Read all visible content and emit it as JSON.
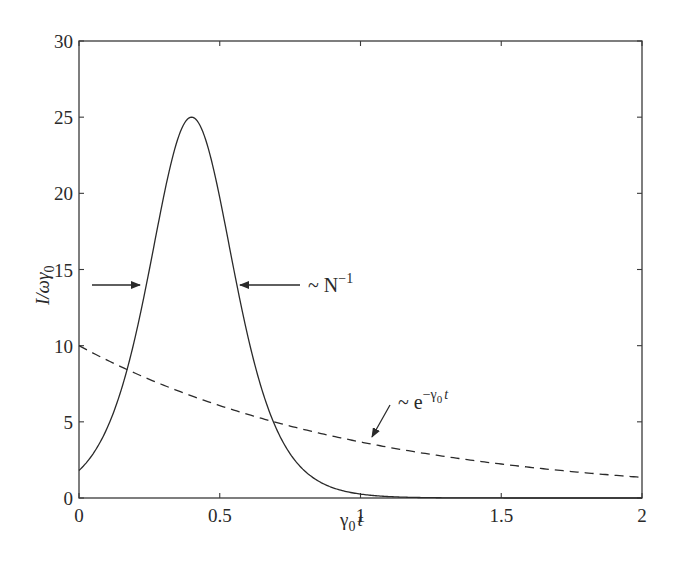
{
  "chart_data": {
    "type": "line",
    "title": "",
    "xlabel": "γ0 t",
    "ylabel": "I/ωγ0",
    "xlim": [
      0,
      2
    ],
    "ylim": [
      0,
      30
    ],
    "xticks": [
      0,
      0.5,
      1,
      1.5,
      2
    ],
    "xtick_labels": [
      "0",
      "0.5",
      "1",
      "1.5",
      "2"
    ],
    "yticks": [
      0,
      5,
      10,
      15,
      20,
      25,
      30
    ],
    "ytick_labels": [
      "0",
      "5",
      "10",
      "15",
      "20",
      "25",
      "30"
    ],
    "grid": false,
    "legend": null,
    "series": [
      {
        "name": "superradiant pulse",
        "style": "solid",
        "x": [
          0,
          0.05,
          0.1,
          0.15,
          0.2,
          0.25,
          0.3,
          0.35,
          0.4,
          0.45,
          0.5,
          0.55,
          0.6,
          0.65,
          0.7,
          0.75,
          0.8,
          0.85,
          0.9,
          0.95,
          1.0,
          1.1,
          1.2,
          1.3,
          1.5,
          2.0
        ],
        "values": [
          1.8,
          2.8,
          4.3,
          6.6,
          9.8,
          14.2,
          19.2,
          23.5,
          25.0,
          23.5,
          19.2,
          14.2,
          9.8,
          6.6,
          4.3,
          2.8,
          1.8,
          1.1,
          0.7,
          0.43,
          0.27,
          0.1,
          0.04,
          0.02,
          0.0,
          0.0
        ]
      },
      {
        "name": "~ e^{-γ0 t}",
        "style": "dashed",
        "x": [
          0,
          0.25,
          0.5,
          0.75,
          1.0,
          1.25,
          1.5,
          1.75,
          2.0
        ],
        "values": [
          10.0,
          7.79,
          6.07,
          4.72,
          3.68,
          2.87,
          2.23,
          1.74,
          1.35
        ]
      }
    ],
    "annotations": [
      {
        "text": "~ N⁻¹",
        "type": "width-arrows",
        "y": 14,
        "x_left": 0.23,
        "x_right": 0.57
      },
      {
        "text": "~ e^(−γ0 t)",
        "type": "arrow",
        "points_to": [
          1.0,
          3.7
        ]
      }
    ]
  },
  "labels": {
    "xlabel_main": "γ",
    "xlabel_sub": "0",
    "xlabel_tail": "t",
    "ylabel_main": "I/ωγ",
    "ylabel_sub": "0",
    "annot_width_prefix": "~ N",
    "annot_width_sup": "−1",
    "annot_exp_prefix": "~ e",
    "annot_exp_sup": "−γ",
    "annot_exp_sup_sub": "0",
    "annot_exp_sup_tail": "t"
  }
}
